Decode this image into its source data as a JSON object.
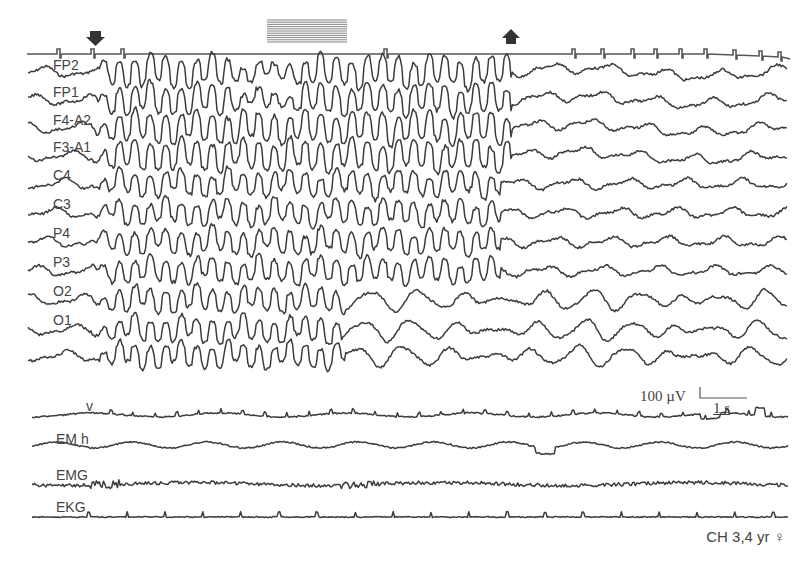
{
  "figure": {
    "caption": "CH 3,4 yr ♀",
    "markers": {
      "onset_arrow": "down-arrow",
      "offset_arrow": "up-arrow",
      "stimulus_bar": "hatched-bar"
    },
    "scale_bar": {
      "amplitude": "100 µV",
      "time": "1 s"
    },
    "channels": [
      {
        "label": "FP2",
        "y": 72
      },
      {
        "label": "FP1",
        "y": 100
      },
      {
        "label": "F4-A2",
        "y": 128
      },
      {
        "label": "F3-A1",
        "y": 156
      },
      {
        "label": "C4",
        "y": 184
      },
      {
        "label": "C3",
        "y": 213
      },
      {
        "label": "P4",
        "y": 242
      },
      {
        "label": "P3",
        "y": 271
      },
      {
        "label": "O2",
        "y": 300
      },
      {
        "label": "O1",
        "y": 330
      },
      {
        "label": "",
        "y": 356
      },
      {
        "label": "v",
        "y": 415
      },
      {
        "label": "EM h",
        "y": 445
      },
      {
        "label": "EMG",
        "y": 484
      },
      {
        "label": "EKG",
        "y": 517
      }
    ],
    "label_positions": [
      {
        "label": "FP2",
        "x": 53,
        "y": 58
      },
      {
        "label": "FP1",
        "x": 53,
        "y": 85
      },
      {
        "label": "F4-A2",
        "x": 53,
        "y": 113
      },
      {
        "label": "F3-A1",
        "x": 53,
        "y": 140
      },
      {
        "label": "C4",
        "x": 53,
        "y": 168
      },
      {
        "label": "C3",
        "x": 53,
        "y": 197
      },
      {
        "label": "P4",
        "x": 53,
        "y": 226
      },
      {
        "label": "P3",
        "x": 53,
        "y": 255
      },
      {
        "label": "O2",
        "x": 53,
        "y": 284
      },
      {
        "label": "O1",
        "x": 53,
        "y": 313
      },
      {
        "label": "v",
        "x": 86,
        "y": 399
      },
      {
        "label": "EM h",
        "x": 56,
        "y": 432
      },
      {
        "label": "EMG",
        "x": 56,
        "y": 468
      },
      {
        "label": "EKG",
        "x": 56,
        "y": 500
      }
    ]
  }
}
